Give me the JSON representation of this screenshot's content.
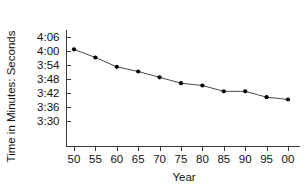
{
  "chart_data": {
    "type": "line",
    "title": "",
    "xlabel": "Year",
    "ylabel": "Time in Minutes: Seconds",
    "grid": false,
    "legend": "none",
    "x_tick_labels": [
      "50",
      "55",
      "60",
      "65",
      "70",
      "75",
      "80",
      "85",
      "90",
      "95",
      "00"
    ],
    "y_tick_labels": [
      "4:06",
      "4:00",
      "3:54",
      "3:48",
      "3:42",
      "3:36",
      "3:30"
    ],
    "y_tick_seconds": [
      246,
      240,
      234,
      228,
      222,
      216,
      210
    ],
    "ylim_seconds": [
      210,
      246
    ],
    "categories": [
      "50",
      "55",
      "60",
      "65",
      "70",
      "75",
      "80",
      "85",
      "90",
      "95",
      "00"
    ],
    "values_label": [
      "4:00",
      "3:57",
      "3:53",
      "3:51",
      "3:48",
      "3:46",
      "3:45",
      "3:42",
      "3:42",
      "3:40",
      "3:39"
    ],
    "values": [
      240.5,
      237.0,
      233.0,
      231.0,
      228.5,
      226.0,
      225.0,
      222.5,
      222.5,
      220.0,
      219.0
    ],
    "marker": "filled-circle",
    "marker_color": "#000000",
    "line_color": "#4a4a4a",
    "axis_color": "#3a3a3a"
  }
}
